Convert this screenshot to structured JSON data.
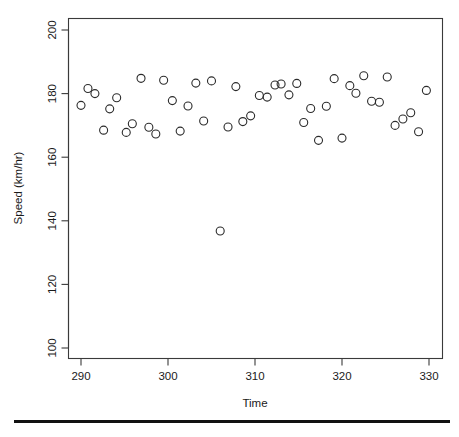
{
  "figure": {
    "background_color": "#ffffff",
    "point_color": "#2b2b2b",
    "axis_color": "#3a3a3a",
    "footer_rule_color": "#111111"
  },
  "axes": {
    "x": {
      "title": "Time",
      "tick_labels": [
        "290",
        "300",
        "310",
        "320",
        "330"
      ],
      "tick_values": [
        290,
        300,
        310,
        320,
        330
      ],
      "range": [
        288.0,
        332.0
      ]
    },
    "y": {
      "title": "Speed (km/hr)",
      "tick_labels": [
        "100",
        "120",
        "140",
        "160",
        "180",
        "200"
      ],
      "tick_values": [
        100,
        120,
        140,
        160,
        180,
        200
      ],
      "range": [
        96.0,
        202.0
      ]
    }
  },
  "chart_data": {
    "type": "scatter",
    "title": "",
    "subtitle": "",
    "xlabel": "Time",
    "ylabel": "Speed (km/hr)",
    "xlim": [
      288.0,
      332.0
    ],
    "ylim": [
      96.0,
      202.0
    ],
    "grid": false,
    "legend": null,
    "marker": "open-circle",
    "marker_size": 4,
    "x": [
      290.0,
      290.8,
      291.6,
      292.6,
      293.3,
      294.1,
      295.2,
      295.9,
      296.9,
      297.8,
      298.6,
      299.5,
      300.5,
      301.4,
      302.3,
      303.2,
      304.1,
      305.0,
      306.0,
      306.9,
      307.8,
      308.6,
      309.5,
      310.5,
      311.4,
      312.3,
      313.0,
      313.9,
      314.8,
      315.6,
      316.4,
      317.3,
      318.2,
      319.1,
      320.0,
      320.9,
      321.6,
      322.5,
      323.4,
      324.3,
      325.2,
      326.1,
      327.0,
      327.9,
      328.8,
      329.7
    ],
    "y": [
      176.3,
      181.6,
      180.0,
      168.5,
      175.2,
      178.7,
      167.8,
      170.5,
      184.8,
      169.4,
      167.3,
      184.2,
      177.8,
      168.2,
      176.1,
      183.3,
      171.4,
      184.0,
      136.8,
      169.5,
      182.2,
      171.2,
      173.0,
      179.4,
      178.9,
      182.7,
      183.0,
      179.6,
      183.2,
      170.9,
      175.3,
      165.3,
      176.0,
      184.7,
      166.0,
      182.5,
      180.1,
      185.6,
      177.6,
      177.3,
      185.2,
      170.0,
      172.0,
      174.0,
      168.0,
      181.0
    ],
    "points": [
      {
        "x": 290.0,
        "y": 176.3
      },
      {
        "x": 290.8,
        "y": 181.6
      },
      {
        "x": 291.6,
        "y": 180.0
      },
      {
        "x": 292.6,
        "y": 168.5
      },
      {
        "x": 293.3,
        "y": 175.2
      },
      {
        "x": 294.1,
        "y": 178.7
      },
      {
        "x": 295.2,
        "y": 167.8
      },
      {
        "x": 295.9,
        "y": 170.5
      },
      {
        "x": 296.9,
        "y": 184.8
      },
      {
        "x": 297.8,
        "y": 169.4
      },
      {
        "x": 298.6,
        "y": 167.3
      },
      {
        "x": 299.5,
        "y": 184.2
      },
      {
        "x": 300.5,
        "y": 177.8
      },
      {
        "x": 301.4,
        "y": 168.2
      },
      {
        "x": 302.3,
        "y": 176.1
      },
      {
        "x": 303.2,
        "y": 183.3
      },
      {
        "x": 304.1,
        "y": 171.4
      },
      {
        "x": 305.0,
        "y": 184.0
      },
      {
        "x": 306.0,
        "y": 136.8
      },
      {
        "x": 306.9,
        "y": 169.5
      },
      {
        "x": 307.8,
        "y": 182.2
      },
      {
        "x": 308.6,
        "y": 171.2
      },
      {
        "x": 309.5,
        "y": 173.0
      },
      {
        "x": 310.5,
        "y": 179.4
      },
      {
        "x": 311.4,
        "y": 178.9
      },
      {
        "x": 312.3,
        "y": 182.7
      },
      {
        "x": 313.0,
        "y": 183.0
      },
      {
        "x": 313.9,
        "y": 179.6
      },
      {
        "x": 314.8,
        "y": 183.2
      },
      {
        "x": 315.6,
        "y": 170.9
      },
      {
        "x": 316.4,
        "y": 175.3
      },
      {
        "x": 317.3,
        "y": 165.3
      },
      {
        "x": 318.2,
        "y": 176.0
      },
      {
        "x": 319.1,
        "y": 184.7
      },
      {
        "x": 320.0,
        "y": 166.0
      },
      {
        "x": 320.9,
        "y": 182.5
      },
      {
        "x": 321.6,
        "y": 180.1
      },
      {
        "x": 322.5,
        "y": 185.6
      },
      {
        "x": 323.4,
        "y": 177.6
      },
      {
        "x": 324.3,
        "y": 177.3
      },
      {
        "x": 325.2,
        "y": 185.2
      }
    ]
  }
}
